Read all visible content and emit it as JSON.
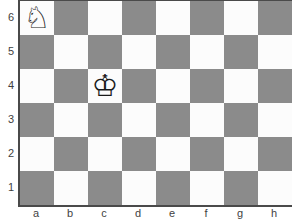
{
  "board": {
    "files": [
      "a",
      "b",
      "c",
      "d",
      "e",
      "f",
      "g",
      "h"
    ],
    "ranks": [
      "6",
      "5",
      "4",
      "3",
      "2",
      "1"
    ],
    "colors": {
      "light_square": "#fcfcfc",
      "dark_square": "#8b8b8b",
      "board_border": "#4a4a4a",
      "label_text": "#3f3f3f",
      "arrow_line": "#9b9b9b",
      "arrow_head": "#3a3a3a"
    },
    "pieces": [
      {
        "square": "a6",
        "piece": "white-knight",
        "glyph": "♘"
      },
      {
        "square": "c4",
        "piece": "white-king",
        "glyph": "♔"
      }
    ],
    "move_arrow": {
      "from": "a6",
      "to": "c5"
    }
  }
}
